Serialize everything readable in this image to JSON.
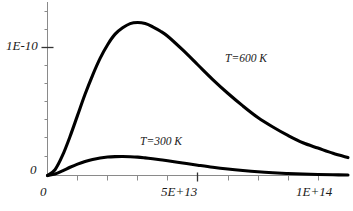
{
  "chart_data": {
    "type": "line",
    "title": "",
    "xlabel": "",
    "ylabel": "",
    "xlim": [
      0,
      100000000000000.0
    ],
    "ylim": [
      0,
      1.55e-10
    ],
    "grid": false,
    "legend_position": "inline-annotation",
    "x_tick_labels": [
      "0",
      "5E+13",
      "1E+14"
    ],
    "x_tick_values": [
      0,
      50000000000000.0,
      100000000000000.0
    ],
    "x_minor_tick_count": 10,
    "y_tick_labels": [
      "0",
      "1E-10"
    ],
    "y_tick_values": [
      0,
      1e-10
    ],
    "y_minor_tick_count": 8,
    "series": [
      {
        "name": "T=300 K",
        "color": "#000000",
        "annotation": "T=300 K",
        "peak_x": 31000000000000.0,
        "peak_y": 1.8e-11,
        "x": [
          0,
          2500000000000.0,
          5000000000000.0,
          7500000000000.0,
          10000000000000.0,
          12500000000000.0,
          15000000000000.0,
          17500000000000.0,
          20000000000000.0,
          22500000000000.0,
          25000000000000.0,
          27500000000000.0,
          30000000000000.0,
          32500000000000.0,
          35000000000000.0,
          37500000000000.0,
          40000000000000.0,
          45000000000000.0,
          50000000000000.0,
          55000000000000.0,
          60000000000000.0,
          65000000000000.0,
          70000000000000.0,
          75000000000000.0,
          80000000000000.0,
          85000000000000.0,
          90000000000000.0,
          95000000000000.0,
          100000000000000.0
        ],
        "y": [
          0,
          1.4e-12,
          4.4e-12,
          7.8e-12,
          1.08e-11,
          1.33e-11,
          1.52e-11,
          1.66e-11,
          1.75e-11,
          1.79e-11,
          1.8e-11,
          1.78e-11,
          1.74e-11,
          1.67e-11,
          1.59e-11,
          1.5e-11,
          1.4e-11,
          1.19e-11,
          9.8e-12,
          7.8e-12,
          6.1e-12,
          4.7e-12,
          3.5e-12,
          2.6e-12,
          1.9e-12,
          1.4e-12,
          1e-12,
          7e-13,
          5e-13
        ]
      },
      {
        "name": "T=600 K",
        "color": "#000000",
        "annotation": "T=600 K",
        "peak_x": 35000000000000.0,
        "peak_y": 1.44e-10,
        "x": [
          0,
          2500000000000.0,
          5000000000000.0,
          7500000000000.0,
          10000000000000.0,
          12500000000000.0,
          15000000000000.0,
          17500000000000.0,
          20000000000000.0,
          22500000000000.0,
          25000000000000.0,
          27500000000000.0,
          30000000000000.0,
          32500000000000.0,
          35000000000000.0,
          37500000000000.0,
          40000000000000.0,
          45000000000000.0,
          50000000000000.0,
          55000000000000.0,
          60000000000000.0,
          65000000000000.0,
          70000000000000.0,
          75000000000000.0,
          80000000000000.0,
          85000000000000.0,
          90000000000000.0,
          95000000000000.0,
          100000000000000.0
        ],
        "y": [
          0,
          5.5e-12,
          1.9e-11,
          3.7e-11,
          5.7e-11,
          7.7e-11,
          9.5e-11,
          1.11e-10,
          1.24e-10,
          1.34e-10,
          1.4e-10,
          1.44e-10,
          1.45e-10,
          1.44e-10,
          1.41e-10,
          1.37e-10,
          1.32e-10,
          1.19e-10,
          1.05e-10,
          9.1e-11,
          7.8e-11,
          6.6e-11,
          5.5e-11,
          4.6e-11,
          3.8e-11,
          3.1e-11,
          2.6e-11,
          2.1e-11,
          1.7e-11
        ]
      }
    ]
  },
  "axes": {
    "y_label_upper": "1E-10",
    "y_label_zero": "0",
    "x_label_zero": "0",
    "x_label_mid": "5E+13",
    "x_label_max": "1E+14"
  },
  "annotations": {
    "t600": "T=600 K",
    "t300": "T=300 K"
  },
  "colors": {
    "curve": "#000000",
    "axis": "#555555",
    "text": "#1a1a1a",
    "background": "#ffffff"
  }
}
